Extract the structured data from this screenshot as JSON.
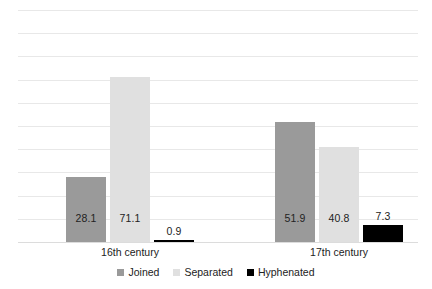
{
  "chart_data": {
    "type": "bar",
    "title": "",
    "subtitle": "",
    "xlabel": "",
    "ylabel": "",
    "categories": [
      "16th century",
      "17th century"
    ],
    "series": [
      {
        "name": "Joined",
        "color": "#9a9a9a",
        "values": [
          28.1,
          51.9
        ]
      },
      {
        "name": "Separated",
        "color": "#e0e0e0",
        "values": [
          71.1,
          40.8
        ]
      },
      {
        "name": "Hyphenated",
        "color": "#000000",
        "values": [
          0.9,
          7.3
        ]
      }
    ],
    "ylim": [
      0,
      100
    ],
    "grid": true,
    "grid_count": 11,
    "legend_position": "bottom",
    "value_labels": [
      "28.1",
      "71.1",
      "0.9",
      "51.9",
      "40.8",
      "7.3"
    ]
  },
  "legend": {
    "items": [
      {
        "label": "Joined"
      },
      {
        "label": "Separated"
      },
      {
        "label": "Hyphenated"
      }
    ]
  },
  "axis": {
    "categories": [
      {
        "label": "16th century"
      },
      {
        "label": "17th century"
      }
    ]
  }
}
